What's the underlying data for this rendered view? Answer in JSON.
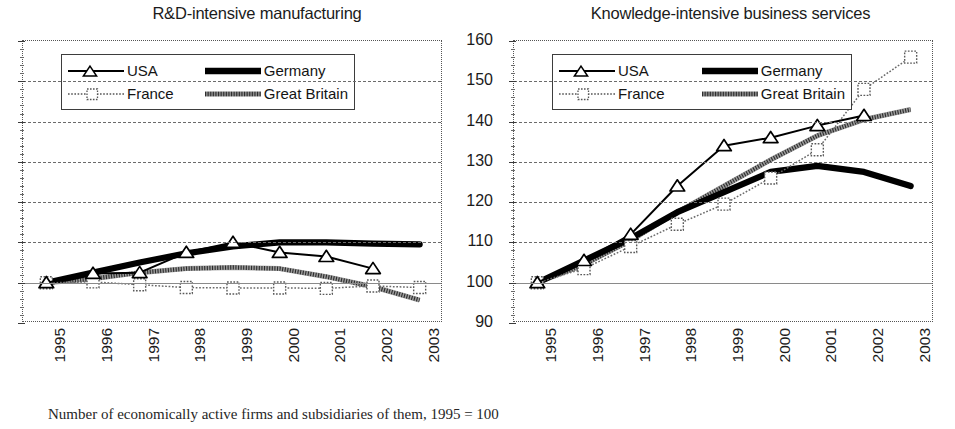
{
  "figure": {
    "caption": "Number of economically active firms and subsidiaries of them, 1995 = 100"
  },
  "legend": {
    "items": [
      {
        "label": "USA",
        "key": "line-triangle-marker-key"
      },
      {
        "label": "Germany",
        "key": "thick-solid-line-key"
      },
      {
        "label": "France",
        "key": "dotted-line-square-marker-key"
      },
      {
        "label": "Great Britain",
        "key": "hatched-line-key"
      }
    ]
  },
  "chart_data": [
    {
      "id": "rd-intensive-manufacturing",
      "type": "line",
      "title": "R&D-intensive manufacturing",
      "xlabel": "",
      "ylabel": "",
      "x": [
        "1995",
        "1996",
        "1997",
        "1998",
        "1999",
        "2000",
        "2001",
        "2002",
        "2003"
      ],
      "xtick_labels": [
        "1995",
        "1996",
        "1997",
        "1998",
        "1999",
        "2000",
        "2001",
        "2002",
        "2003"
      ],
      "ytick_labels": [
        "90",
        "100",
        "110",
        "120",
        "130",
        "140",
        "150",
        "160"
      ],
      "ylim": [
        90,
        160
      ],
      "ytick_values": [
        90,
        100,
        110,
        120,
        130,
        140,
        150,
        160
      ],
      "grid": true,
      "grid_axis": "y",
      "baseline_value": 100,
      "legend_position": "top-left",
      "series": [
        {
          "name": "USA",
          "values": [
            100.0,
            102.3,
            102.5,
            107.5,
            110.0,
            107.5,
            106.5,
            103.5,
            null
          ]
        },
        {
          "name": "Germany",
          "values": [
            100.0,
            102.5,
            105.0,
            107.3,
            109.0,
            110.0,
            110.0,
            109.7,
            109.5
          ]
        },
        {
          "name": "France",
          "values": [
            100.0,
            100.2,
            99.5,
            98.8,
            98.7,
            98.7,
            98.6,
            99.2,
            98.8
          ]
        },
        {
          "name": "Great Britain",
          "values": [
            100.0,
            101.0,
            102.5,
            103.5,
            103.8,
            103.5,
            101.5,
            99.0,
            95.7
          ]
        }
      ]
    },
    {
      "id": "knowledge-intensive-business-services",
      "type": "line",
      "title": "Knowledge-intensive business services",
      "xlabel": "",
      "ylabel": "",
      "x": [
        "1995",
        "1996",
        "1997",
        "1998",
        "1999",
        "2000",
        "2001",
        "2002",
        "2003"
      ],
      "xtick_labels": [
        "1995",
        "1996",
        "1997",
        "1998",
        "1999",
        "2000",
        "2001",
        "2002",
        "2003"
      ],
      "ytick_labels": [
        "90",
        "100",
        "110",
        "120",
        "130",
        "140",
        "150",
        "160"
      ],
      "ylim": [
        90,
        160
      ],
      "ytick_values": [
        90,
        100,
        110,
        120,
        130,
        140,
        150,
        160
      ],
      "grid": true,
      "grid_axis": "y",
      "baseline_value": 100,
      "legend_position": "top-left",
      "series": [
        {
          "name": "USA",
          "values": [
            100.0,
            105.5,
            112.0,
            124.0,
            134.0,
            136.0,
            139.0,
            141.5,
            null
          ]
        },
        {
          "name": "Germany",
          "values": [
            100.0,
            105.5,
            111.0,
            117.5,
            122.5,
            127.5,
            129.0,
            127.5,
            124.0
          ]
        },
        {
          "name": "France",
          "values": [
            100.0,
            103.5,
            109.0,
            114.5,
            119.5,
            126.0,
            133.0,
            148.0,
            156.0
          ]
        },
        {
          "name": "Great Britain",
          "values": [
            100.0,
            104.5,
            110.5,
            117.5,
            124.0,
            130.5,
            136.5,
            140.5,
            143.0
          ]
        }
      ]
    }
  ]
}
